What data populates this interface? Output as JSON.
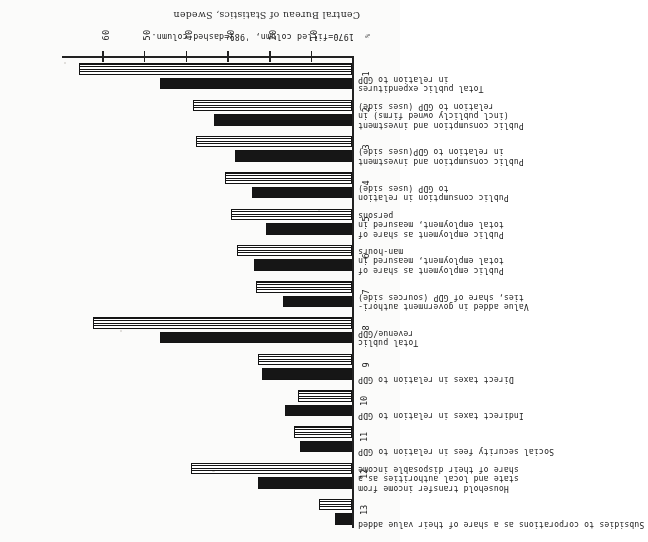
{
  "figure": {
    "legend_note": "1970=filled column, '981=dashed column.",
    "source_note": "Central Bureau of Statistics, Sweden",
    "axis_unit_mark": "%",
    "value_axis": {
      "ticks": [
        10,
        20,
        30,
        40,
        50,
        60
      ],
      "tick_labels": [
        "10",
        "20",
        "30",
        "40",
        "50",
        "60"
      ],
      "min": 0,
      "max": 70
    }
  },
  "chart_data": {
    "type": "bar",
    "orientation": "horizontal",
    "title": "",
    "xlabel": "%",
    "ylabel": "",
    "xlim": [
      0,
      70
    ],
    "grid": false,
    "legend_position": "below-axis",
    "legend": [
      "1970=filled column",
      "'981=dashed column"
    ],
    "categories": [
      "1",
      "2",
      "3",
      "4",
      "5",
      "6",
      "7",
      "8",
      "9",
      "10",
      "11",
      "12",
      "13"
    ],
    "category_labels": [
      "Total public expenditures\nin relation to GDP",
      "Public consumption and investment\n(incl publicly owned firms) in\nrelation to GDP (uses side)",
      "Public consumption and investment\nin relation to GDP(uses side)",
      "Public consumption in relation\nto GDP (uses side)",
      "Public employment as share of\ntotal employment, measured in\npersons",
      "Public employment as share of\ntotal employment, measured in\nman-hours",
      "Value added in government authori-\nties, share of GDP (sources side)",
      "Total public\nrevenue/GDP",
      "Direct taxes in relation to GDP",
      "Indirect taxes in relation to GDP",
      "Social security fees in relation to GDP",
      "Household transfer income from\nstate and local authorities as a\nshare of their disposable income",
      "Subsidies to corporations as a share of their value added"
    ],
    "series": [
      {
        "name": "1970=filled column",
        "style": "filled",
        "values": [
          46.0,
          33.0,
          28.0,
          24.0,
          20.5,
          23.5,
          16.5,
          46.0,
          21.5,
          16.0,
          12.5,
          22.5,
          4.0
        ]
      },
      {
        "name": "'981=dashed column",
        "style": "dashed",
        "values": [
          65.5,
          38.0,
          37.5,
          30.5,
          29.0,
          27.5,
          23.0,
          62.0,
          22.5,
          13.0,
          14.0,
          38.5,
          8.0
        ]
      }
    ]
  }
}
